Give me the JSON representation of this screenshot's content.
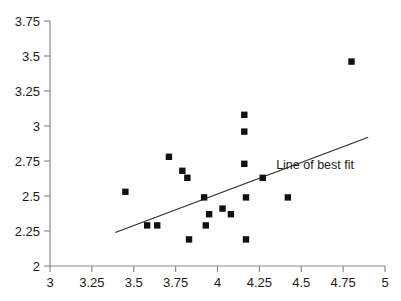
{
  "chart_data": {
    "type": "scatter",
    "title": "",
    "xlabel": "",
    "ylabel": "",
    "xlim": [
      3,
      5
    ],
    "ylim": [
      2,
      3.75
    ],
    "grid": false,
    "legend_position": "none",
    "x_ticks": [
      "3",
      "3.25",
      "3.5",
      "3.75",
      "4",
      "4.25",
      "4.5",
      "4.75",
      "5"
    ],
    "x_tick_values": [
      3,
      3.25,
      3.5,
      3.75,
      4,
      4.25,
      4.5,
      4.75,
      5
    ],
    "y_ticks": [
      "2",
      "2.25",
      "2.5",
      "2.75",
      "3",
      "3.25",
      "3.5",
      "3.75"
    ],
    "y_tick_values": [
      2,
      2.25,
      2.5,
      2.75,
      3,
      3.25,
      3.5,
      3.75
    ],
    "series": [
      {
        "name": "observations",
        "marker": "square",
        "color": "#111111",
        "points": [
          {
            "x": 3.45,
            "y": 2.53
          },
          {
            "x": 3.58,
            "y": 2.29
          },
          {
            "x": 3.64,
            "y": 2.29
          },
          {
            "x": 3.71,
            "y": 2.78
          },
          {
            "x": 3.79,
            "y": 2.68
          },
          {
            "x": 3.82,
            "y": 2.63
          },
          {
            "x": 3.83,
            "y": 2.19
          },
          {
            "x": 3.92,
            "y": 2.49
          },
          {
            "x": 3.93,
            "y": 2.29
          },
          {
            "x": 3.95,
            "y": 2.37
          },
          {
            "x": 4.03,
            "y": 2.41
          },
          {
            "x": 4.08,
            "y": 2.37
          },
          {
            "x": 4.16,
            "y": 3.08
          },
          {
            "x": 4.16,
            "y": 2.96
          },
          {
            "x": 4.16,
            "y": 2.73
          },
          {
            "x": 4.17,
            "y": 2.49
          },
          {
            "x": 4.17,
            "y": 2.19
          },
          {
            "x": 4.27,
            "y": 2.63
          },
          {
            "x": 4.42,
            "y": 2.49
          },
          {
            "x": 4.8,
            "y": 3.46
          }
        ]
      }
    ],
    "annotations": [
      {
        "name": "line-of-best-fit-label",
        "text": "Line of best fit",
        "x": 4.35,
        "y": 2.69
      }
    ],
    "trendline": {
      "label": "Line of best fit",
      "x_start": 3.39,
      "y_start": 2.24,
      "x_end": 4.9,
      "y_end": 2.92,
      "color": "#2b2b2b"
    }
  }
}
